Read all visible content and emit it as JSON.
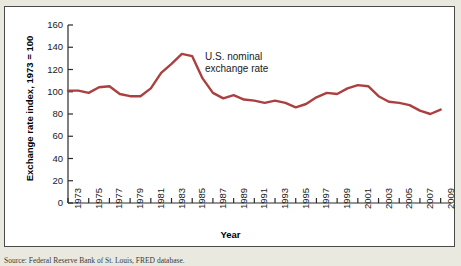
{
  "figure": {
    "y_axis_title": "Exchange rate index, 1973 = 100",
    "x_axis_title": "Year",
    "annotation": "U.S. nominal\nexchange rate",
    "source_note": "Source: Federal Reserve Bank of St. Louis, FRED database."
  },
  "colors": {
    "series_line": "#ac3f3f",
    "axis": "#2b2b2b",
    "plot_background": "#ffffff",
    "page_background": "#e9e9e0",
    "frame_border": "#4a4a4a"
  },
  "chart_data": {
    "type": "line",
    "title": "",
    "subtitle": "",
    "xlabel": "Year",
    "ylabel": "Exchange rate index, 1973 = 100",
    "xlim": [
      1973,
      2010
    ],
    "ylim": [
      0,
      160
    ],
    "y_ticks": [
      0,
      20,
      40,
      60,
      80,
      100,
      120,
      140,
      160
    ],
    "x_ticks": [
      1973,
      1975,
      1977,
      1979,
      1981,
      1983,
      1985,
      1987,
      1989,
      1991,
      1993,
      1995,
      1997,
      1999,
      2001,
      2003,
      2005,
      2007,
      2009
    ],
    "x_tick_labels": [
      "1973",
      "1975",
      "1977",
      "1979",
      "1981",
      "1983",
      "1985",
      "1987",
      "1989",
      "1991",
      "1993",
      "1995",
      "1997",
      "1999",
      "2001",
      "2003",
      "2005",
      "2007",
      "2009"
    ],
    "grid": false,
    "legend": "none",
    "annotations": [
      {
        "text": "U.S. nominal exchange rate",
        "x": 1991,
        "y": 133
      }
    ],
    "series": [
      {
        "name": "U.S. nominal exchange rate",
        "color": "#ac3f3f",
        "x": [
          1973,
          1974,
          1975,
          1976,
          1977,
          1978,
          1979,
          1980,
          1981,
          1982,
          1983,
          1984,
          1985,
          1986,
          1987,
          1988,
          1989,
          1990,
          1991,
          1992,
          1993,
          1994,
          1995,
          1996,
          1997,
          1998,
          1999,
          2000,
          2001,
          2002,
          2003,
          2004,
          2005,
          2006,
          2007,
          2008,
          2009
        ],
        "values": [
          101,
          101,
          99,
          104,
          105,
          98,
          96,
          96,
          103,
          117,
          125,
          134,
          132,
          112,
          99,
          94,
          97,
          93,
          92,
          90,
          92,
          90,
          86,
          89,
          95,
          99,
          98,
          103,
          106,
          105,
          96,
          91,
          90,
          88,
          83,
          80,
          84
        ]
      }
    ]
  }
}
